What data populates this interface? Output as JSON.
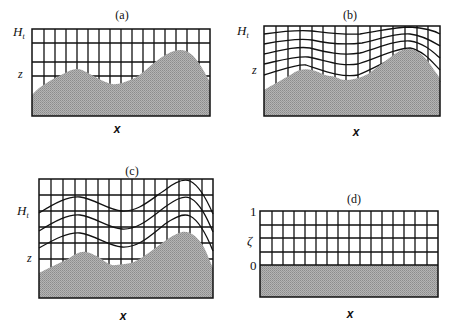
{
  "figure": {
    "panels": [
      {
        "id": "a",
        "title": "(a)",
        "y_top_label": "H",
        "y_top_sub": "t",
        "y_mid_label": "z",
        "x_label": "x",
        "description": "Rectangular height-coordinate grid intersected by terrain"
      },
      {
        "id": "b",
        "title": "(b)",
        "y_top_label": "H",
        "y_top_sub": "t",
        "y_mid_label": "z",
        "x_label": "x",
        "description": "Terrain-following coordinate surfaces decaying with height above terrain"
      },
      {
        "id": "c",
        "title": "(c)",
        "y_top_label": "H",
        "y_top_sub": "t",
        "y_mid_label": "z",
        "x_label": "x",
        "description": "Terrain-following coordinate surfaces with full terrain amplitude aloft"
      },
      {
        "id": "d",
        "title": "(d)",
        "y_top_label": "1",
        "y_mid_label": "ζ",
        "y_bottom_label": "0",
        "x_label": "x",
        "description": "Transformed computational domain with flat lower boundary"
      }
    ],
    "colors": {
      "grid": "#111111",
      "terrain": "#a8a8a8",
      "background": "#ffffff"
    }
  }
}
